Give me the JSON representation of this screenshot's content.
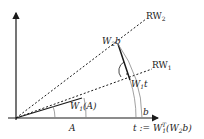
{
  "diagram": {
    "labels": {
      "rw2": "RW",
      "rw2_sub": "2",
      "rw1": "RW",
      "rw1_sub": "1",
      "w2b": "W",
      "w2b_sub": "2",
      "w2b_tail": "b",
      "w1t": "W",
      "w1t_sub": "1",
      "w1t_tail": "t",
      "w1a": "W",
      "w1a_sub": "1",
      "w1a_tail": "(A)",
      "a": "A",
      "b": "b",
      "t_def": "t := W",
      "t_def_sub": "1",
      "t_def_sup": "T",
      "t_def_tail": "(W",
      "t_def_sub2": "2",
      "t_def_end": "b)"
    },
    "colors": {
      "line": "#1a1a1a",
      "arc": "#888888"
    }
  }
}
